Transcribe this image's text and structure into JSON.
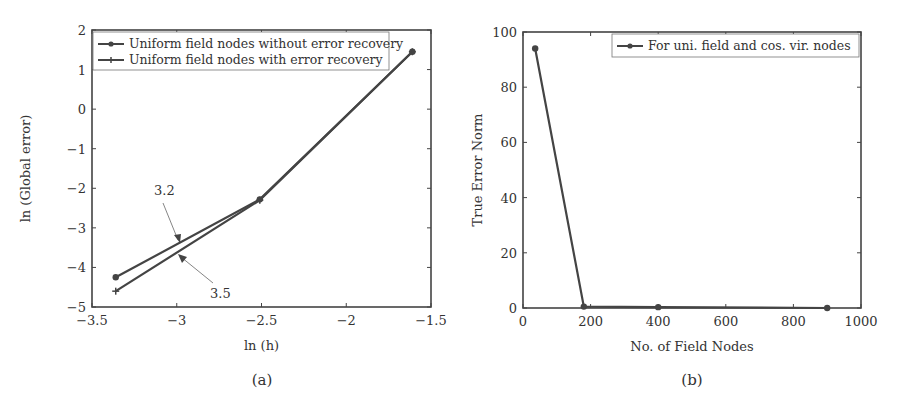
{
  "chart_data": [
    {
      "type": "line",
      "panel_label": "(a)",
      "title": "",
      "xlabel": "ln (h)",
      "ylabel": "ln (Global error)",
      "xlim": [
        -3.5,
        -1.5
      ],
      "ylim": [
        -5,
        2
      ],
      "xticks": [
        "-3.5",
        "-3",
        "-2.5",
        "-2",
        "-1.5"
      ],
      "yticks": [
        "2",
        "1",
        "0",
        "-1",
        "-2",
        "-3",
        "-4",
        "-5"
      ],
      "grid": false,
      "legend_position": "upper left",
      "series": [
        {
          "name": "Uniform field nodes without error recovery",
          "marker": "dot",
          "x": [
            -3.36,
            -2.51,
            -1.61
          ],
          "y": [
            -4.25,
            -2.28,
            1.45
          ]
        },
        {
          "name": "Uniform field nodes with error recovery",
          "marker": "plus",
          "x": [
            -3.36,
            -2.51,
            -1.61
          ],
          "y": [
            -4.6,
            -2.3,
            1.45
          ]
        }
      ],
      "annotations": [
        {
          "text": "3.2",
          "points_to_series": 0
        },
        {
          "text": "3.5",
          "points_to_series": 1
        }
      ]
    },
    {
      "type": "line",
      "panel_label": "(b)",
      "title": "",
      "xlabel": "No. of Field Nodes",
      "ylabel": "True Error Norm",
      "xlim": [
        0,
        1000
      ],
      "ylim": [
        0,
        100
      ],
      "xticks": [
        "0",
        "200",
        "400",
        "600",
        "800",
        "1000"
      ],
      "yticks": [
        "100",
        "80",
        "60",
        "40",
        "20",
        "0"
      ],
      "grid": false,
      "legend_position": "upper right",
      "series": [
        {
          "name": "For uni. field and cos. vir. nodes",
          "marker": "dot",
          "x": [
            36,
            180,
            400,
            900
          ],
          "y": [
            94,
            0.5,
            0.3,
            0
          ]
        }
      ]
    }
  ]
}
